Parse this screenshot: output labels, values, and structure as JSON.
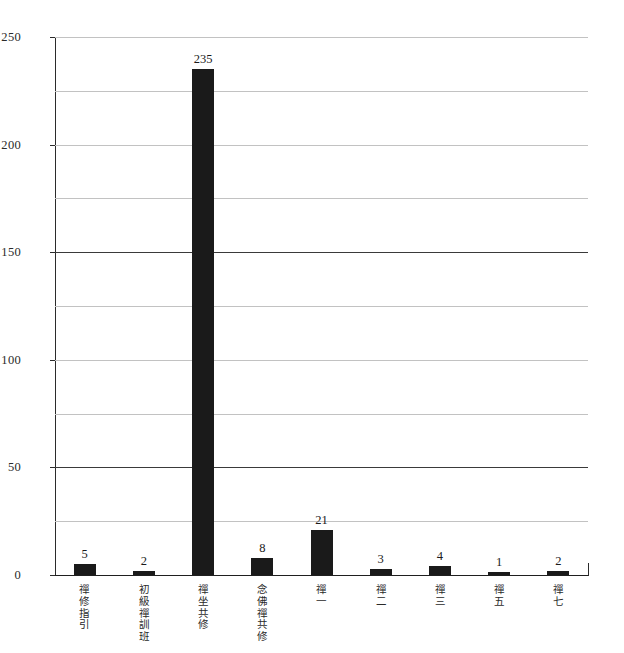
{
  "chart_data": {
    "type": "bar",
    "title": "",
    "subtitle": "",
    "xlabel": "",
    "ylabel": "",
    "categories": [
      "禪修指引",
      "初級禪訓班",
      "禪坐共修",
      "念佛禪共修",
      "禪一",
      "禪二",
      "禪三",
      "禪五",
      "禪七"
    ],
    "values": [
      5,
      2,
      235,
      8,
      21,
      3,
      4,
      1,
      2
    ],
    "value_labels": [
      "5",
      "2",
      "235",
      "8",
      "21",
      "3",
      "4",
      "1",
      "2"
    ],
    "ylim": [
      0,
      250
    ],
    "y_tick_labels": [
      "250",
      "200",
      "150",
      "100",
      "50",
      "0"
    ],
    "y_tick_values": [
      250,
      200,
      150,
      100,
      50,
      0
    ],
    "y_gridline_values": [
      250,
      225,
      200,
      175,
      150,
      125,
      100,
      75,
      50,
      25,
      0
    ],
    "y_major_gridline_values": [
      150,
      50
    ],
    "grid": true,
    "legend": false,
    "legend_position": "none",
    "series": [
      {
        "name": "",
        "values": [
          5,
          2,
          235,
          8,
          21,
          3,
          4,
          1,
          2
        ]
      }
    ],
    "colors": {
      "bar_fill": "#1a1a1a",
      "gridline": "#c2c2c2",
      "gridline_major": "#3a3a3a",
      "axis": "#2b2b2b",
      "background": "#ffffff",
      "text": "#1a1a1a"
    }
  }
}
